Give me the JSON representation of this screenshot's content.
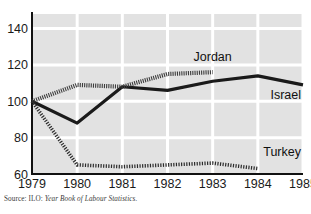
{
  "chart_data": {
    "type": "line",
    "title": "",
    "subtitle": "",
    "xlabel": "",
    "ylabel": "",
    "x": [
      1979,
      1980,
      1981,
      1982,
      1983,
      1984,
      1985
    ],
    "xtick_labels": [
      "1979",
      "1980",
      "1981",
      "1982",
      "1983",
      "1984",
      "1985"
    ],
    "ytick_labels": [
      "60",
      "80",
      "100",
      "120",
      "140"
    ],
    "yticks": [
      60,
      80,
      100,
      120,
      140
    ],
    "xlim": [
      1979,
      1985
    ],
    "ylim": [
      60,
      148
    ],
    "grid": true,
    "grid_color": "#ffffff",
    "panel_color": "#e2e2e2",
    "legend": "inline-labels",
    "series": [
      {
        "name": "Israel",
        "style": "solid",
        "color": "#1a1a1a",
        "x": [
          1979,
          1980,
          1981,
          1982,
          1983,
          1984,
          1985
        ],
        "values": [
          100,
          88,
          108,
          106,
          111,
          114,
          109
        ]
      },
      {
        "name": "Jordan",
        "style": "cross-hatched",
        "color": "#3c3c3c",
        "x": [
          1979,
          1980,
          1981,
          1982,
          1983
        ],
        "values": [
          100,
          109,
          108,
          115,
          116
        ]
      },
      {
        "name": "Turkey",
        "style": "dashed",
        "color": "#2b2b2b",
        "x": [
          1979,
          1980,
          1981,
          1982,
          1983,
          1984
        ],
        "values": [
          100,
          65,
          64,
          65,
          66,
          63
        ]
      }
    ],
    "annotations": [
      {
        "name": "Jordan",
        "x": 1983,
        "y": 122
      },
      {
        "name": "Israel",
        "x": 1985,
        "y": 101
      },
      {
        "name": "Turkey",
        "x": 1984.6,
        "y": 70
      }
    ]
  },
  "source": {
    "prefix": "Source: ILO:",
    "title": "Year Book of Labour Statistics."
  }
}
